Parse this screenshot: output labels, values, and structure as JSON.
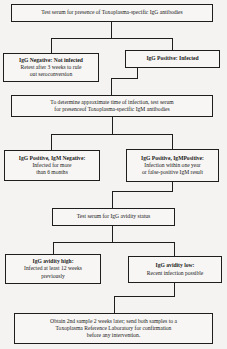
{
  "flowchart": {
    "step1": {
      "text": "Test serum for presence of Toxoplasma-specific IgG antibodies"
    },
    "igg_negative": {
      "heading": "IgG Negative: Not infected",
      "lines": [
        "Retest after 3 weeks to rule",
        "out seroconversion"
      ]
    },
    "igg_positive": {
      "heading": "IgG Positive: Infected"
    },
    "step2": {
      "lines": [
        "To determine approximate time of infection, test serum",
        "for presenceof Toxoplasma-specific IgM antibodies"
      ]
    },
    "igg_pos_igm_neg": {
      "heading": "IgG Positive, IgM Negative:",
      "lines": [
        "Infected for more",
        "than 6 months"
      ]
    },
    "igg_pos_igm_pos": {
      "heading": "IgG Positive, IgMPositive:",
      "lines": [
        "Infection within one year",
        "or false-positive IgM result"
      ]
    },
    "step3": {
      "text": "Test serum for IgG avidity status"
    },
    "avidity_high": {
      "heading": "IgG avidity high:",
      "lines": [
        "Infected at least 12 weeks",
        "previously"
      ]
    },
    "avidity_low": {
      "heading": "IgG avidity low:",
      "lines": [
        "Recent infection possible"
      ]
    },
    "final": {
      "lines": [
        "Obtain 2nd sample 2 weeks later; send both samples to a",
        "Toxoplasma Reference Laboratory for confirmation",
        "before any intervention."
      ]
    }
  }
}
